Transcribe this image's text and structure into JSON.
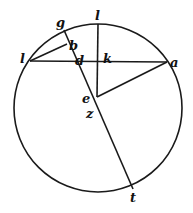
{
  "figure": {
    "type": "geometric-diagram",
    "circle": {
      "cx": 98,
      "cy": 108,
      "r": 84
    },
    "lines": [
      {
        "id": "chord-l-a",
        "x1": 30,
        "y1": 61,
        "x2": 167,
        "y2": 62
      },
      {
        "id": "vertical-top-e",
        "x1": 98,
        "y1": 24,
        "x2": 97,
        "y2": 97
      },
      {
        "id": "line-g-t",
        "x1": 64,
        "y1": 30,
        "x2": 133,
        "y2": 189
      },
      {
        "id": "line-l-b",
        "x1": 30,
        "y1": 61,
        "x2": 67,
        "y2": 44
      },
      {
        "id": "line-a-e",
        "x1": 167,
        "y1": 62,
        "x2": 97,
        "y2": 97
      }
    ],
    "labels": [
      {
        "id": "label-top",
        "text": "l",
        "x": 95,
        "y": 20
      },
      {
        "id": "label-g",
        "text": "g",
        "x": 56,
        "y": 27
      },
      {
        "id": "label-b",
        "text": "b",
        "x": 69,
        "y": 50
      },
      {
        "id": "label-left",
        "text": "l",
        "x": 20,
        "y": 63
      },
      {
        "id": "label-d",
        "text": "d",
        "x": 75,
        "y": 65
      },
      {
        "id": "label-k",
        "text": "k",
        "x": 103,
        "y": 63
      },
      {
        "id": "label-a",
        "text": "a",
        "x": 170,
        "y": 67
      },
      {
        "id": "label-e",
        "text": "e",
        "x": 82,
        "y": 103
      },
      {
        "id": "label-z",
        "text": "z",
        "x": 86,
        "y": 118
      },
      {
        "id": "label-t",
        "text": "t",
        "x": 130,
        "y": 202
      }
    ]
  }
}
